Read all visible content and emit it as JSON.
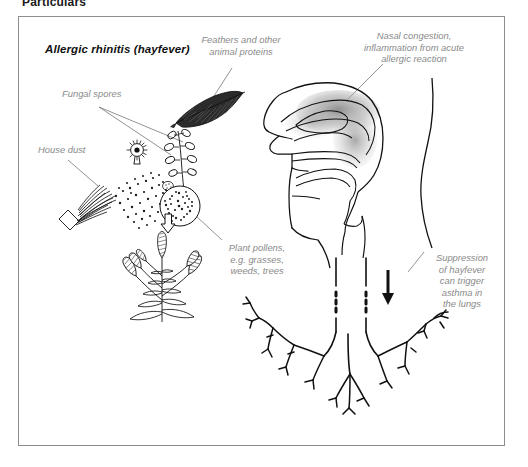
{
  "page": {
    "heading": "Particulars"
  },
  "figure": {
    "title": "Allergic rhinitis (hayfever)",
    "frame_border_color": "#8d8d8d",
    "background_color": "#ffffff",
    "label_color": "#8a8a8a",
    "ink_color": "#111111",
    "inflammation_shade_color": "#9a9a9a"
  },
  "callouts": [
    {
      "id": "fungal-spores",
      "text": "Fungal spores",
      "align": "left"
    },
    {
      "id": "feathers-animal-proteins",
      "text": "Feathers and other\nanimal proteins",
      "align": "center"
    },
    {
      "id": "nasal-congestion",
      "text": "Nasal congestion,\ninflammation from acute\nallergic reaction",
      "align": "center"
    },
    {
      "id": "house-dust",
      "text": "House dust",
      "align": "left"
    },
    {
      "id": "plant-pollens",
      "text": "Plant pollens,\ne.g. grasses,\nweeds, trees",
      "align": "center"
    },
    {
      "id": "asthma-suppression",
      "text": "Suppression\nof hayfever\ncan trigger\nasthma in\nthe lungs",
      "align": "center"
    }
  ],
  "illustration": {
    "items": [
      {
        "name": "feather",
        "description": "dark quill feather"
      },
      {
        "name": "fungal-spore-round",
        "description": "round spiked fungal spore"
      },
      {
        "name": "fungal-spore-branched",
        "description": "branched conidiophore fungal spore"
      },
      {
        "name": "house-dust-brush",
        "description": "brush with scattered dust specks"
      },
      {
        "name": "pollen-grain",
        "description": "stippled circular pollen grain"
      },
      {
        "name": "grass-plant",
        "description": "flowering grass plant with seed spikes"
      },
      {
        "name": "head-sagittal-section",
        "description": "side view of head showing nasal cavity, pharynx and larynx"
      },
      {
        "name": "bronchial-tree",
        "description": "trachea branching into bronchi of the lungs"
      },
      {
        "name": "down-arrow",
        "description": "solid arrow pointing down the airway"
      },
      {
        "name": "pollen-up-arrow",
        "description": "hollow arrow pointing up at pollen grain"
      }
    ]
  }
}
